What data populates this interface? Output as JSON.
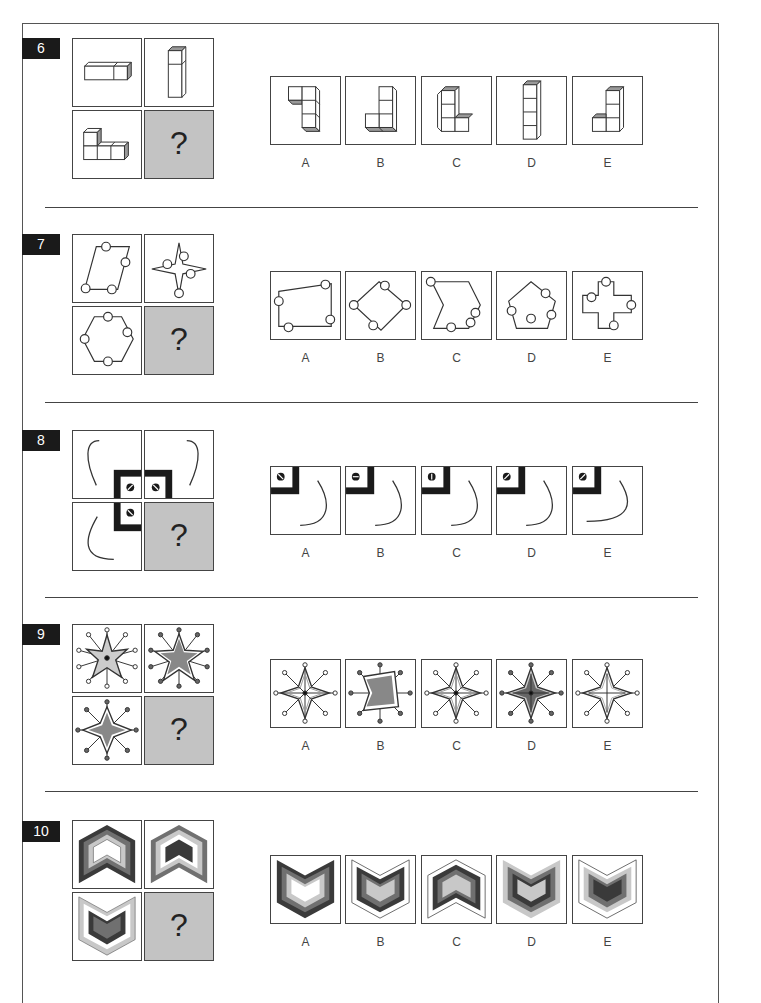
{
  "questions": [
    {
      "number": "6",
      "prompt_cells": [
        "bar-of-3-cubes-horizontal",
        "column-of-3-cubes-vertical",
        "L-shape-4-cubes",
        "unknown"
      ],
      "missing_symbol": "?",
      "options": [
        {
          "label": "A",
          "figure": "hook-shape-4-cubes"
        },
        {
          "label": "B",
          "figure": "J-shape-4-cubes"
        },
        {
          "label": "C",
          "figure": "L-shape-4-cubes-tall"
        },
        {
          "label": "D",
          "figure": "column-of-4-cubes"
        },
        {
          "label": "E",
          "figure": "J-shape-4-cubes-small"
        }
      ]
    },
    {
      "number": "7",
      "prompt_cells": [
        "parallelogram-with-4-circles",
        "4-point-star-with-4-circles",
        "hexagon-with-4-circles",
        "unknown"
      ],
      "missing_symbol": "?",
      "options": [
        {
          "label": "A",
          "figure": "quadrilateral-with-4-circles"
        },
        {
          "label": "B",
          "figure": "rhombus-with-4-circles"
        },
        {
          "label": "C",
          "figure": "chevron-polygon-with-4-circles"
        },
        {
          "label": "D",
          "figure": "pentagon-with-4-circles"
        },
        {
          "label": "E",
          "figure": "cross-with-4-circles"
        }
      ]
    },
    {
      "number": "8",
      "prompt_cells": [
        "curve-top-left",
        "curve-top-right",
        "curve-bottom-left",
        "unknown"
      ],
      "missing_symbol": "?",
      "options": [
        {
          "label": "A",
          "figure": "screw-backslash-curve"
        },
        {
          "label": "B",
          "figure": "screw-horizontal-curve"
        },
        {
          "label": "C",
          "figure": "screw-vertical-curve"
        },
        {
          "label": "D",
          "figure": "screw-slash-curve"
        },
        {
          "label": "E",
          "figure": "screw-slash-long-curve"
        }
      ]
    },
    {
      "number": "9",
      "prompt_cells": [
        "6-point-star-striped-with-spokes",
        "5-point-star-grey-with-spokes",
        "4-point-star-grey-with-spokes",
        "unknown"
      ],
      "missing_symbol": "?",
      "options": [
        {
          "label": "A",
          "figure": "4-point-star-striped-center-dot"
        },
        {
          "label": "B",
          "figure": "4-point-star-grey-filled"
        },
        {
          "label": "C",
          "figure": "4-point-star-striped-center-dot-alt"
        },
        {
          "label": "D",
          "figure": "4-point-star-dark-grey-center-dot"
        },
        {
          "label": "E",
          "figure": "4-point-star-white-inner-outline"
        }
      ]
    },
    {
      "number": "10",
      "prompt_cells": [
        "chevron-up-dark-to-white",
        "chevron-up-dark-center",
        "chevron-down-light-outer",
        "unknown"
      ],
      "missing_symbol": "?",
      "options": [
        {
          "label": "A",
          "figure": "chevron-down-dark-outer-white-center"
        },
        {
          "label": "B",
          "figure": "chevron-down-white-outer-light-center"
        },
        {
          "label": "C",
          "figure": "chevron-up-white-outer-light-center"
        },
        {
          "label": "D",
          "figure": "chevron-down-light-outer-light-center"
        },
        {
          "label": "E",
          "figure": "chevron-down-white-outer-dark-center"
        }
      ]
    }
  ],
  "colors": {
    "dark": "#3a3a3a",
    "mid": "#707070",
    "light": "#c8c8c8",
    "question_cell": "#c3c3c3",
    "badge": "#1a1a1a"
  }
}
